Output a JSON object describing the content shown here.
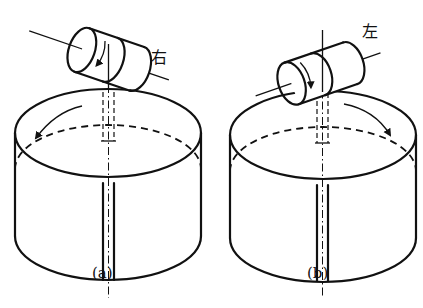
{
  "figure": {
    "panels": [
      {
        "id": "a",
        "caption": "(a)",
        "roller_label": "右",
        "roller_rotation": "downward (toward viewer on front face)",
        "disk_rotation_arrow": "counter-clockwise (pointing down-left)"
      },
      {
        "id": "b",
        "caption": "(b)",
        "roller_label": "左",
        "roller_rotation": "downward (toward viewer on front face)",
        "disk_rotation_arrow": "clockwise (pointing down-right)"
      }
    ],
    "colors": {
      "line": "#111111",
      "background": "#ffffff"
    }
  }
}
